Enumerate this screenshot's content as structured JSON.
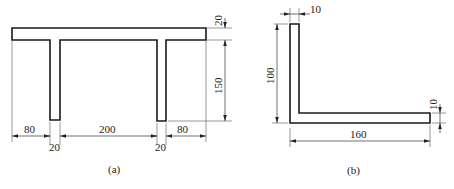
{
  "figure_a": {
    "caption": "(a)",
    "shape": "T-beam frame with two legs",
    "dimensions": {
      "top_flange_thickness": "20",
      "leg_height": "150",
      "left_overhang": "80",
      "leg1_width": "20",
      "between_legs": "200",
      "leg2_width": "20",
      "right_overhang": "80"
    }
  },
  "figure_b": {
    "caption": "(b)",
    "shape": "L-section (angle)",
    "dimensions": {
      "vertical_leg_thickness": "10",
      "vertical_height": "100",
      "horizontal_leg_thickness": "10",
      "horizontal_length": "160"
    }
  },
  "colors": {
    "line": "#1a1a1a",
    "background": "#ffffff"
  }
}
